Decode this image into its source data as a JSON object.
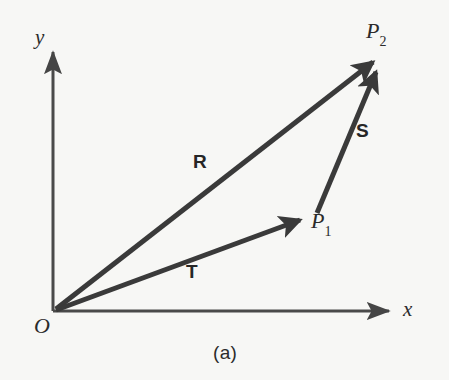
{
  "figure": {
    "caption": "(a)",
    "background_color": "#f7f7f5",
    "ink_color": "#3a3a3a",
    "text_color": "#2b2b2b"
  },
  "axes": {
    "x_label": "x",
    "y_label": "y",
    "origin_label": "O",
    "origin_px": [
      53,
      311
    ],
    "x_axis_tip_px": [
      393,
      311
    ],
    "y_axis_tip_px": [
      53,
      48
    ],
    "axis_color": "#4a4a4a",
    "axis_width_px": 3
  },
  "points": [
    {
      "id": "P1",
      "base": "P",
      "subscript": "1",
      "label": "P₁",
      "px": [
        310,
        216
      ]
    },
    {
      "id": "P2",
      "base": "P",
      "subscript": "2",
      "label": "P₂",
      "px": [
        379,
        57
      ]
    }
  ],
  "vectors": [
    {
      "id": "R",
      "label": "R",
      "from": "O",
      "to": "P2",
      "from_px": [
        56,
        309
      ],
      "to_px": [
        379,
        57
      ],
      "label_px": [
        193,
        152
      ],
      "color": "#3a3a3a",
      "width_px": 5
    },
    {
      "id": "S",
      "label": "S",
      "from": "P1",
      "to": "P2",
      "from_px": [
        317,
        213
      ],
      "to_px": [
        381,
        60
      ],
      "label_px": [
        356,
        121
      ],
      "color": "#3a3a3a",
      "width_px": 5
    },
    {
      "id": "T",
      "label": "T",
      "from": "O",
      "to": "P1",
      "from_px": [
        56,
        310
      ],
      "to_px": [
        308,
        217
      ],
      "label_px": [
        186,
        262
      ],
      "color": "#3a3a3a",
      "width_px": 5
    }
  ],
  "relation": "R = T + S"
}
